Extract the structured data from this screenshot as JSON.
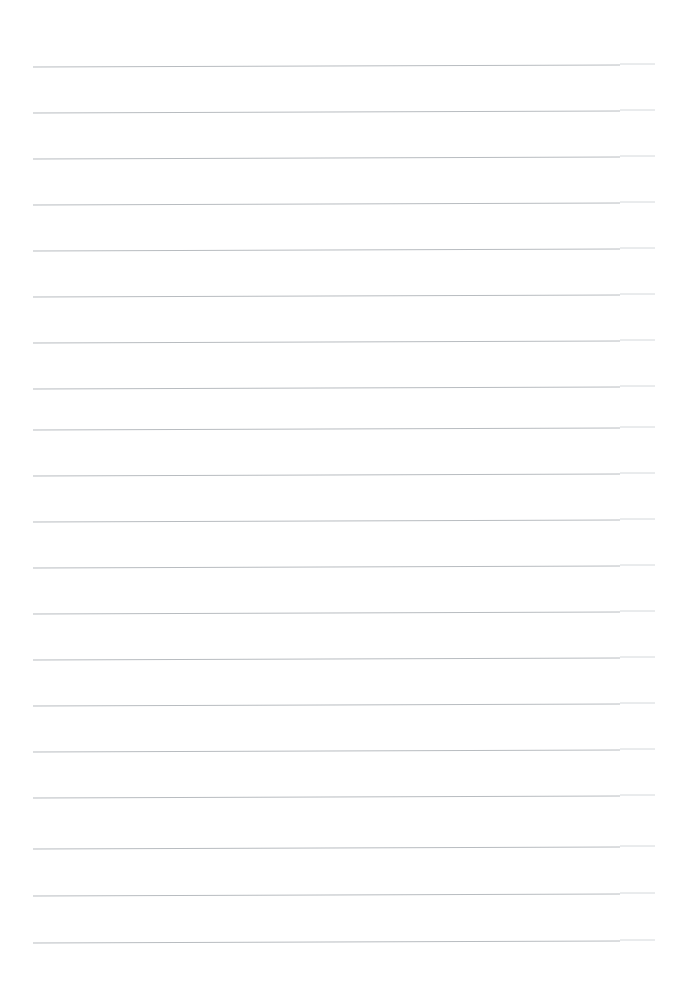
{
  "page": {
    "kind": "lined-notebook-page",
    "width": 676,
    "height": 985,
    "background_color": "#ffffff",
    "content_text": "",
    "is_blank": true
  },
  "ruling": {
    "line_color": "#b8bcc0",
    "line_tail_color": "#d4d8db",
    "line_count": 20,
    "line_width_px": 1,
    "left_margin_px": 33,
    "right_end_px": 655,
    "step_x_px": 620,
    "line_spacing_px": 46.2,
    "first_line_y_px": 66,
    "last_line_y_px": 943,
    "slope_rise_px": -2,
    "lines": [
      {
        "index": 1,
        "y_left": 67,
        "y_step": 65,
        "y_right": 64
      },
      {
        "index": 2,
        "y_left": 113,
        "y_step": 111,
        "y_right": 110
      },
      {
        "index": 3,
        "y_left": 159,
        "y_step": 157,
        "y_right": 156
      },
      {
        "index": 4,
        "y_left": 205,
        "y_step": 203,
        "y_right": 202
      },
      {
        "index": 5,
        "y_left": 251,
        "y_step": 249,
        "y_right": 248
      },
      {
        "index": 6,
        "y_left": 297,
        "y_step": 295,
        "y_right": 294
      },
      {
        "index": 7,
        "y_left": 343,
        "y_step": 341,
        "y_right": 340
      },
      {
        "index": 8,
        "y_left": 389,
        "y_step": 387,
        "y_right": 386
      },
      {
        "index": 9,
        "y_left": 430,
        "y_step": 428,
        "y_right": 427
      },
      {
        "index": 10,
        "y_left": 476,
        "y_step": 474,
        "y_right": 473
      },
      {
        "index": 11,
        "y_left": 522,
        "y_step": 520,
        "y_right": 519
      },
      {
        "index": 12,
        "y_left": 568,
        "y_step": 566,
        "y_right": 565
      },
      {
        "index": 13,
        "y_left": 614,
        "y_step": 612,
        "y_right": 611
      },
      {
        "index": 14,
        "y_left": 660,
        "y_step": 658,
        "y_right": 657
      },
      {
        "index": 15,
        "y_left": 706,
        "y_step": 704,
        "y_right": 703
      },
      {
        "index": 16,
        "y_left": 752,
        "y_step": 750,
        "y_right": 749
      },
      {
        "index": 17,
        "y_left": 798,
        "y_step": 796,
        "y_right": 795
      },
      {
        "index": 18,
        "y_left": 849,
        "y_step": 847,
        "y_right": 846
      },
      {
        "index": 19,
        "y_left": 896,
        "y_step": 894,
        "y_right": 893
      },
      {
        "index": 20,
        "y_left": 943,
        "y_step": 941,
        "y_right": 940
      }
    ]
  }
}
